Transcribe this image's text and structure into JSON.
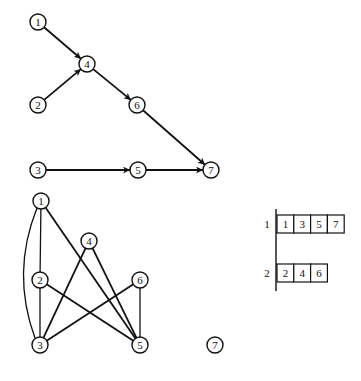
{
  "directed_graph": {
    "nodes": [
      {
        "id": "1",
        "label": "1",
        "x": 38,
        "y": 22
      },
      {
        "id": "2",
        "label": "2",
        "x": 38,
        "y": 105
      },
      {
        "id": "3",
        "label": "3",
        "x": 38,
        "y": 170
      },
      {
        "id": "4",
        "label": "4",
        "x": 87,
        "y": 64
      },
      {
        "id": "5",
        "label": "5",
        "x": 138,
        "y": 170
      },
      {
        "id": "6",
        "label": "6",
        "x": 137,
        "y": 105
      },
      {
        "id": "7",
        "label": "7",
        "x": 211,
        "y": 170
      }
    ],
    "edges": [
      {
        "from": "1",
        "to": "4"
      },
      {
        "from": "2",
        "to": "4"
      },
      {
        "from": "4",
        "to": "6"
      },
      {
        "from": "6",
        "to": "7"
      },
      {
        "from": "3",
        "to": "5"
      },
      {
        "from": "5",
        "to": "7"
      }
    ]
  },
  "undirected_graph": {
    "nodes": [
      {
        "id": "1",
        "label": "1",
        "x": 41,
        "y": 201
      },
      {
        "id": "2",
        "label": "2",
        "x": 40,
        "y": 280
      },
      {
        "id": "3",
        "label": "3",
        "x": 40,
        "y": 345
      },
      {
        "id": "4",
        "label": "4",
        "x": 89,
        "y": 241
      },
      {
        "id": "5",
        "label": "5",
        "x": 140,
        "y": 345
      },
      {
        "id": "6",
        "label": "6",
        "x": 140,
        "y": 280
      },
      {
        "id": "7",
        "label": "7",
        "x": 215,
        "y": 345
      }
    ],
    "edges": [
      {
        "from": "1",
        "to": "2",
        "thin": true
      },
      {
        "from": "2",
        "to": "3",
        "thin": true
      },
      {
        "from": "1",
        "to": "3",
        "curved": true
      },
      {
        "from": "1",
        "to": "5"
      },
      {
        "from": "4",
        "to": "3"
      },
      {
        "from": "4",
        "to": "5"
      },
      {
        "from": "2",
        "to": "5"
      },
      {
        "from": "6",
        "to": "3"
      },
      {
        "from": "6",
        "to": "5",
        "thin": true
      }
    ]
  },
  "partition_table": {
    "rows": [
      {
        "label": "1",
        "cells": [
          "1",
          "3",
          "5",
          "7"
        ]
      },
      {
        "label": "2",
        "cells": [
          "2",
          "4",
          "6"
        ]
      }
    ]
  }
}
